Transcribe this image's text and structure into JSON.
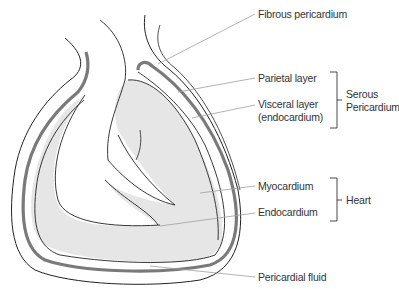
{
  "diagram": {
    "labels": {
      "fibrous": "Fibrous pericardium",
      "parietal": "Parietal layer",
      "visceral_1": "Visceral layer",
      "visceral_2": "(endocardium)",
      "myocardium": "Myocardium",
      "endocardium": "Endocardium",
      "fluid": "Pericardial fluid"
    },
    "groups": {
      "serous_1": "Serous",
      "serous_2": "Pericardium",
      "heart": "Heart"
    },
    "colors": {
      "outline": "#222222",
      "pericardium_band": "#7a7a7a",
      "myocardium_fill": "#e6e6e6",
      "leader_line": "#a0a0a0"
    }
  }
}
